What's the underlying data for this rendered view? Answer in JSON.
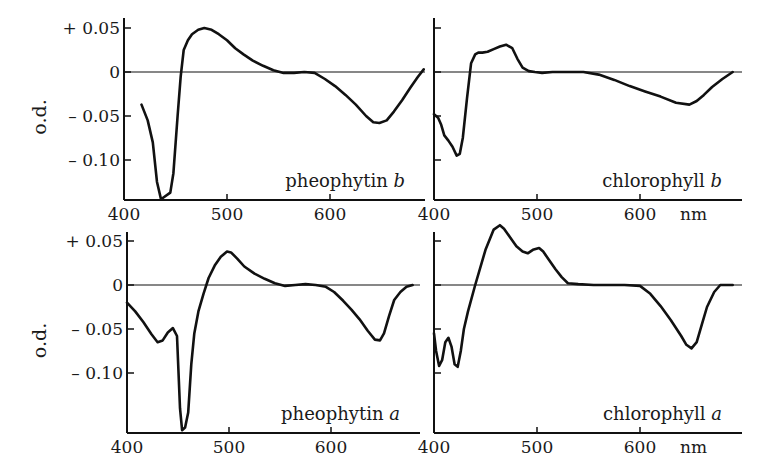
{
  "figure": {
    "ylabel": "o.d.",
    "x_unit": "nm",
    "y_tick_labels": [
      "+ 0.05",
      "0",
      "– 0.05",
      "– 0.10"
    ],
    "x_tick_labels": [
      "400",
      "500",
      "600"
    ],
    "line_color": "#111111",
    "background": "#ffffff"
  },
  "chart_data": [
    {
      "type": "line",
      "title": "pheophytin b",
      "label_main": "pheophytin ",
      "label_italic": "b",
      "position": "top-left",
      "xlabel": "",
      "ylabel": "o.d.",
      "xlim": [
        400,
        692
      ],
      "ylim": [
        -0.145,
        0.062
      ],
      "yticks": [
        0.05,
        0,
        -0.05,
        -0.1
      ],
      "xticks": [
        400,
        500,
        600
      ],
      "zero_line": true,
      "x": [
        417,
        423,
        428,
        432,
        436,
        438,
        445,
        448,
        452,
        455,
        458,
        462,
        466,
        472,
        478,
        485,
        492,
        500,
        508,
        516,
        525,
        535,
        545,
        555,
        565,
        575,
        585,
        595,
        605,
        615,
        625,
        635,
        642,
        648,
        655,
        662,
        670,
        678,
        685,
        691
      ],
      "y": [
        -0.037,
        -0.055,
        -0.08,
        -0.125,
        -0.145,
        -0.143,
        -0.137,
        -0.115,
        -0.05,
        -0.005,
        0.025,
        0.036,
        0.043,
        0.048,
        0.05,
        0.048,
        0.043,
        0.036,
        0.027,
        0.02,
        0.013,
        0.007,
        0.002,
        -0.001,
        -0.001,
        0.0,
        -0.001,
        -0.008,
        -0.016,
        -0.026,
        -0.037,
        -0.05,
        -0.057,
        -0.058,
        -0.055,
        -0.045,
        -0.032,
        -0.018,
        -0.006,
        0.003
      ]
    },
    {
      "type": "line",
      "title": "chlorophyll b",
      "label_main": "chlorophyll ",
      "label_italic": "b",
      "position": "top-right",
      "xlabel": "nm",
      "ylabel": "o.d.",
      "xlim": [
        400,
        695
      ],
      "ylim": [
        -0.145,
        0.062
      ],
      "yticks": [
        0.05,
        0,
        -0.05,
        -0.1
      ],
      "xticks": [
        400,
        500,
        600
      ],
      "zero_line": true,
      "x": [
        400,
        404,
        407,
        410,
        414,
        418,
        422,
        425,
        428,
        432,
        436,
        440,
        443,
        447,
        452,
        458,
        464,
        470,
        476,
        481,
        486,
        492,
        498,
        505,
        515,
        530,
        545,
        560,
        575,
        590,
        605,
        620,
        635,
        648,
        655,
        662,
        670,
        680,
        690
      ],
      "y": [
        -0.048,
        -0.052,
        -0.06,
        -0.072,
        -0.078,
        -0.085,
        -0.095,
        -0.093,
        -0.075,
        -0.03,
        0.01,
        0.02,
        0.022,
        0.022,
        0.023,
        0.026,
        0.029,
        0.031,
        0.027,
        0.015,
        0.005,
        0.001,
        0.0,
        -0.001,
        0.0,
        0.0,
        0.0,
        -0.003,
        -0.009,
        -0.016,
        -0.022,
        -0.028,
        -0.035,
        -0.037,
        -0.033,
        -0.026,
        -0.017,
        -0.008,
        0.0
      ]
    },
    {
      "type": "line",
      "title": "pheophytin a",
      "label_main": "pheophytin ",
      "label_italic": "a",
      "position": "bottom-left",
      "xlabel": "",
      "ylabel": "o.d.",
      "xlim": [
        400,
        686
      ],
      "ylim": [
        -0.168,
        0.062
      ],
      "yticks": [
        0.05,
        0,
        -0.05,
        -0.1
      ],
      "xticks": [
        400,
        500,
        600
      ],
      "zero_line": true,
      "x": [
        400,
        408,
        416,
        424,
        430,
        435,
        440,
        445,
        449,
        452,
        454,
        457,
        460,
        463,
        466,
        470,
        475,
        480,
        486,
        492,
        498,
        502,
        508,
        515,
        525,
        535,
        545,
        555,
        565,
        575,
        585,
        595,
        603,
        612,
        620,
        628,
        636,
        643,
        648,
        652,
        657,
        662,
        668,
        674,
        680
      ],
      "y": [
        -0.02,
        -0.03,
        -0.042,
        -0.056,
        -0.065,
        -0.063,
        -0.054,
        -0.049,
        -0.058,
        -0.14,
        -0.165,
        -0.162,
        -0.145,
        -0.09,
        -0.055,
        -0.03,
        -0.01,
        0.008,
        0.022,
        0.032,
        0.038,
        0.037,
        0.03,
        0.021,
        0.013,
        0.007,
        0.002,
        -0.001,
        0.0,
        0.001,
        0.0,
        -0.002,
        -0.008,
        -0.018,
        -0.028,
        -0.039,
        -0.052,
        -0.062,
        -0.063,
        -0.055,
        -0.035,
        -0.017,
        -0.008,
        -0.002,
        0.0
      ]
    },
    {
      "type": "line",
      "title": "chlorophyll a",
      "label_main": "chlorophyll ",
      "label_italic": "a",
      "position": "bottom-right",
      "xlabel": "nm",
      "ylabel": "o.d.",
      "xlim": [
        400,
        695
      ],
      "ylim": [
        -0.168,
        0.062
      ],
      "yticks": [
        0.05,
        0,
        -0.05,
        -0.1
      ],
      "xticks": [
        400,
        500,
        600
      ],
      "zero_line": true,
      "x": [
        400,
        402,
        405,
        408,
        411,
        414,
        417,
        420,
        423,
        426,
        429,
        433,
        440,
        450,
        458,
        464,
        468,
        474,
        480,
        486,
        491,
        496,
        502,
        506,
        512,
        518,
        524,
        530,
        540,
        555,
        570,
        585,
        600,
        610,
        620,
        630,
        640,
        645,
        650,
        655,
        660,
        665,
        672,
        678,
        684,
        690
      ],
      "y": [
        -0.055,
        -0.075,
        -0.092,
        -0.085,
        -0.065,
        -0.06,
        -0.07,
        -0.09,
        -0.093,
        -0.075,
        -0.05,
        -0.03,
        0.0,
        0.04,
        0.063,
        0.068,
        0.064,
        0.054,
        0.044,
        0.038,
        0.036,
        0.04,
        0.042,
        0.038,
        0.028,
        0.018,
        0.009,
        0.002,
        0.001,
        0.0,
        0.0,
        0.0,
        -0.001,
        -0.01,
        -0.024,
        -0.04,
        -0.058,
        -0.068,
        -0.072,
        -0.065,
        -0.045,
        -0.025,
        -0.008,
        0.0,
        0.0,
        0.0
      ]
    }
  ]
}
